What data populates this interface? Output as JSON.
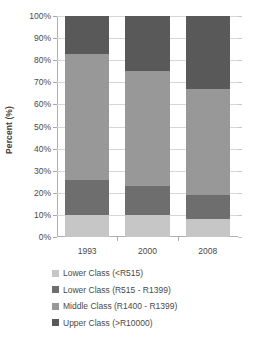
{
  "chart_data": {
    "type": "bar",
    "subtype": "stacked-percent",
    "title": "",
    "xlabel": "",
    "ylabel": "Percent (%)",
    "categories": [
      "1993",
      "2000",
      "2008"
    ],
    "ylim": [
      0,
      100
    ],
    "ytick_labels": [
      "0%",
      "10%",
      "20%",
      "30%",
      "40%",
      "50%",
      "60%",
      "70%",
      "80%",
      "90%",
      "100%"
    ],
    "ytick_values": [
      0,
      10,
      20,
      30,
      40,
      50,
      60,
      70,
      80,
      90,
      100
    ],
    "grid": true,
    "legend_position": "bottom",
    "series": [
      {
        "name": "Lower Class (<R515)",
        "color": "#c6c6c6",
        "values": [
          10,
          10,
          8
        ]
      },
      {
        "name": "Lower Class (R515 - R1399)",
        "color": "#6e6e6e",
        "values": [
          16,
          13,
          11
        ]
      },
      {
        "name": "Middle Class (R1400 - R1399)",
        "color": "#989898",
        "values": [
          57,
          52,
          48
        ]
      },
      {
        "name": "Upper Class (>R10000)",
        "color": "#595959",
        "values": [
          17,
          25,
          33
        ]
      }
    ]
  }
}
